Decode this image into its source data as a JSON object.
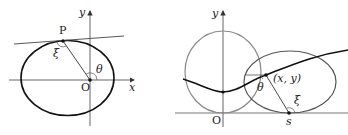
{
  "left_diagram": {
    "axes": {
      "x_label": "x",
      "y_label": "y",
      "origin_label": "O"
    },
    "point_label": "P",
    "angle_labels": {
      "xi": "ξ",
      "theta": "θ"
    }
  },
  "right_diagram": {
    "axes": {
      "y_label": "y",
      "origin_label": "O"
    },
    "point_label": "(x, y)",
    "contact_label": "s",
    "angle_labels": {
      "theta": "θ",
      "xi": "ξ"
    }
  },
  "colors": {
    "curve": "#111111",
    "gray_curve": "#8a8a8a",
    "axis": "#444444"
  }
}
